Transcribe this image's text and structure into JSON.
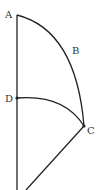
{
  "diagram": {
    "points": {
      "A": {
        "label": "A",
        "x": 17,
        "y": 15
      },
      "B": {
        "label": "B"
      },
      "C": {
        "label": "C",
        "x": 84,
        "y": 126
      },
      "D": {
        "label": "D",
        "x": 17,
        "y": 98
      }
    },
    "colors": {
      "line": "#222222",
      "label": "#333333"
    }
  }
}
